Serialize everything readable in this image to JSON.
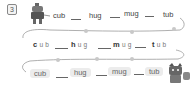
{
  "exercise": {
    "number": "3",
    "rows": [
      {
        "style": "plain",
        "words": [
          "cub",
          "hug",
          "mug",
          "tub"
        ]
      },
      {
        "style": "spaced",
        "words": [
          "cub",
          "hug",
          "mug",
          "tub"
        ]
      },
      {
        "style": "pill",
        "words": [
          "cub",
          "hug",
          "mug",
          "tub"
        ]
      }
    ],
    "characters": [
      "robot-character",
      "cat-character"
    ]
  },
  "colors": {
    "track": "#9a9a9a",
    "marker": "#c8c8c8",
    "text": "#444444"
  }
}
